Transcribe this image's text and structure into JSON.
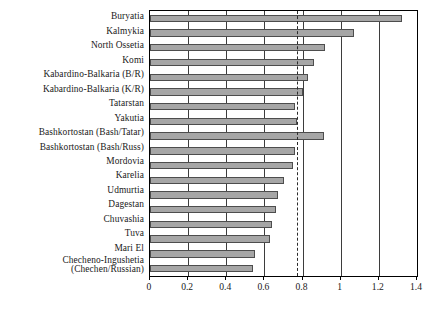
{
  "chart_data": {
    "type": "bar",
    "orientation": "horizontal",
    "title": "",
    "xlabel": "",
    "ylabel": "",
    "xlim": [
      0,
      1.4
    ],
    "xticks": [
      0,
      0.2,
      0.4,
      0.6,
      0.8,
      1,
      1.2,
      1.4
    ],
    "xtick_labels": [
      "0",
      "0.2",
      "0.4",
      "0.6",
      "0.8",
      "1",
      "1.2",
      "1.4"
    ],
    "grid": "vertical",
    "legend": "none",
    "reference_line": {
      "value": 0.77,
      "style": "dashed"
    },
    "categories": [
      "Buryatia",
      "Kalmykia",
      "North Ossetia",
      "Komi",
      "Kabardino-Balkaria (B/R)",
      "Kabardino-Balkaria (K/R)",
      "Tatarstan",
      "Yakutia",
      "Bashkortostan (Bash/Tatar)",
      "Bashkortostan (Bash/Russ)",
      "Mordovia",
      "Karelia",
      "Udmurtia",
      "Dagestan",
      "Chuvashia",
      "Tuva",
      "Mari El",
      "Checheno-Ingushetia (Chechen/Russian)"
    ],
    "category_lines": [
      [
        "Buryatia"
      ],
      [
        "Kalmykia"
      ],
      [
        "North Ossetia"
      ],
      [
        "Komi"
      ],
      [
        "Kabardino-Balkaria (B/R)"
      ],
      [
        "Kabardino-Balkaria (K/R)"
      ],
      [
        "Tatarstan"
      ],
      [
        "Yakutia"
      ],
      [
        "Bashkortostan (Bash/Tatar)"
      ],
      [
        "Bashkortostan (Bash/Russ)"
      ],
      [
        "Mordovia"
      ],
      [
        "Karelia"
      ],
      [
        "Udmurtia"
      ],
      [
        "Dagestan"
      ],
      [
        "Chuvashia"
      ],
      [
        "Tuva"
      ],
      [
        "Mari El"
      ],
      [
        "Checheno-Ingushetia",
        "(Chechen/Russian)"
      ]
    ],
    "values": [
      1.32,
      1.07,
      0.92,
      0.86,
      0.83,
      0.8,
      0.76,
      0.77,
      0.91,
      0.76,
      0.75,
      0.7,
      0.67,
      0.66,
      0.64,
      0.63,
      0.55,
      0.54
    ]
  },
  "style": {
    "bar_fill": "#a6a6a6",
    "bar_border": "#4d4d4d",
    "axis_color": "#000000",
    "grid_color": "#3d3d3d",
    "background": "#ffffff"
  }
}
